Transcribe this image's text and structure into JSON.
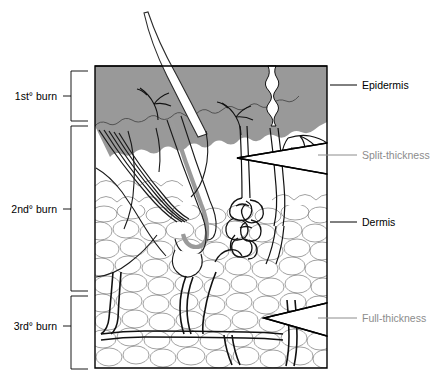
{
  "figure": {
    "colors": {
      "epidermis_fill": "#999999",
      "outline": "#000000",
      "tissue_line": "#808080",
      "gray_label": "#8c8c8c",
      "hair_shaft": "#8c8c8c",
      "background": "#ffffff"
    }
  },
  "left_labels": [
    {
      "id": "first-degree",
      "text": "1st° burn",
      "bracket_top": 71,
      "bracket_bottom": 121,
      "tick_y": 96
    },
    {
      "id": "second-degree",
      "text": "2nd° burn",
      "bracket_top": 126,
      "bracket_bottom": 291,
      "tick_y": 209
    },
    {
      "id": "third-degree",
      "text": "3rd° burn",
      "bracket_top": 296,
      "bracket_bottom": 369,
      "tick_y": 326
    }
  ],
  "right_labels": [
    {
      "id": "epidermis",
      "text": "Epidermis",
      "style": "dark",
      "leader_y": 85,
      "leader_x1": 330,
      "leader_x2": 357,
      "text_x": 362
    },
    {
      "id": "split-thickness",
      "text": "Split-thickness",
      "style": "gray",
      "leader_y": 155,
      "leader_x1": 318,
      "leader_x2": 357,
      "text_x": 362
    },
    {
      "id": "dermis",
      "text": "Dermis",
      "style": "dark",
      "leader_y": 222,
      "leader_x1": 330,
      "leader_x2": 357,
      "text_x": 362
    },
    {
      "id": "full-thickness",
      "text": "Full-thickness",
      "style": "gray",
      "leader_y": 318,
      "leader_x1": 318,
      "leader_x2": 357,
      "text_x": 362
    }
  ],
  "anatomy": [
    {
      "id": "hair-shaft",
      "name": "hair shaft"
    },
    {
      "id": "epidermis-band",
      "name": "epidermis layer"
    },
    {
      "id": "dermis-region",
      "name": "dermis layer"
    },
    {
      "id": "hair-follicle",
      "name": "hair follicle"
    },
    {
      "id": "sweat-gland",
      "name": "coiled sweat gland"
    },
    {
      "id": "sweat-duct",
      "name": "sweat duct"
    },
    {
      "id": "arrector-pili",
      "name": "arrector pili muscle"
    },
    {
      "id": "nerve-endings",
      "name": "nerve endings"
    },
    {
      "id": "subcutaneous-fat",
      "name": "subcutaneous fat tissue"
    },
    {
      "id": "blood-vessels",
      "name": "blood vessels"
    },
    {
      "id": "split-thickness-wedge",
      "name": "split-thickness burn depth wedge"
    },
    {
      "id": "full-thickness-wedge",
      "name": "full-thickness burn depth wedge"
    }
  ],
  "diagram_box": {
    "x": 95,
    "y": 65,
    "width": 232,
    "height": 303
  }
}
